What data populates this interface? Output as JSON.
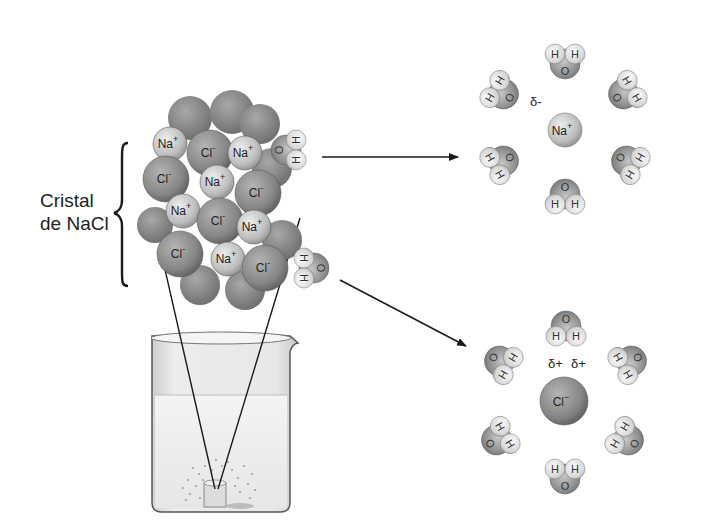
{
  "diagram": {
    "crystal_label": {
      "line1": "Cristal",
      "line2": "de NaCl"
    },
    "crystal_ions": [
      {
        "label": "Na",
        "charge": "+",
        "x": 170,
        "y": 144,
        "r": 17,
        "type": "na"
      },
      {
        "label": "Cl",
        "charge": "-",
        "x": 210,
        "y": 153,
        "r": 23,
        "type": "cl"
      },
      {
        "label": "Na",
        "charge": "+",
        "x": 245,
        "y": 153,
        "r": 17,
        "type": "na"
      },
      {
        "label": "Cl",
        "charge": "-",
        "x": 166,
        "y": 179,
        "r": 23,
        "type": "cl"
      },
      {
        "label": "Na",
        "charge": "+",
        "x": 217,
        "y": 182,
        "r": 17,
        "type": "na"
      },
      {
        "label": "Cl",
        "charge": "-",
        "x": 258,
        "y": 193,
        "r": 23,
        "type": "cl"
      },
      {
        "label": "Na",
        "charge": "+",
        "x": 183,
        "y": 211,
        "r": 17,
        "type": "na"
      },
      {
        "label": "Cl",
        "charge": "-",
        "x": 220,
        "y": 221,
        "r": 23,
        "type": "cl"
      },
      {
        "label": "Na",
        "charge": "+",
        "x": 254,
        "y": 227,
        "r": 17,
        "type": "na"
      },
      {
        "label": "Cl",
        "charge": "-",
        "x": 180,
        "y": 254,
        "r": 23,
        "type": "cl"
      },
      {
        "label": "Na",
        "charge": "+",
        "x": 228,
        "y": 259,
        "r": 17,
        "type": "na"
      },
      {
        "label": "Cl",
        "charge": "-",
        "x": 265,
        "y": 268,
        "r": 23,
        "type": "cl"
      }
    ],
    "crystal_waters": [
      {
        "o": "O",
        "h1": "H",
        "h2": "H",
        "x": 292,
        "y": 155
      },
      {
        "o": "O",
        "h1": "H",
        "h2": "H",
        "x": 310,
        "y": 268
      }
    ],
    "beaker": {
      "label": "beaker with dissolving salt"
    },
    "hydration_na": {
      "center_ion": {
        "label": "Na",
        "charge": "+",
        "x": 565,
        "y": 130
      },
      "partial_charge_label": "δ-",
      "water_labels": {
        "o": "O",
        "h": "H"
      }
    },
    "hydration_cl": {
      "center_ion": {
        "label": "Cl",
        "charge": "−",
        "x": 564,
        "y": 401
      },
      "partial_charge_labels": [
        "δ+",
        "δ+"
      ],
      "water_labels": {
        "o": "O",
        "h": "H"
      }
    },
    "arrows": [
      {
        "from": [
          322,
          157
        ],
        "to": [
          458,
          157
        ]
      },
      {
        "from": [
          340,
          280
        ],
        "to": [
          466,
          346
        ]
      }
    ],
    "colors": {
      "cl": "#8a8a8a",
      "na": "#c4c4c4",
      "oxygen": "#9a9a9a",
      "hydrogen": "#e2e2e2",
      "line": "#222222"
    }
  }
}
